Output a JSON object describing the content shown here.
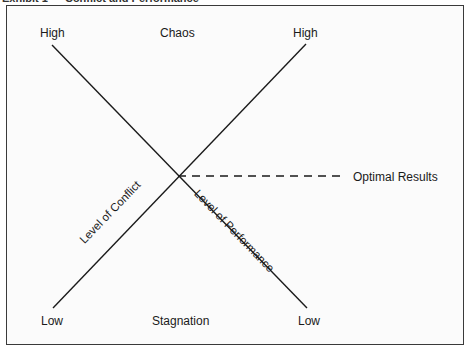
{
  "caption": "Exhibit 1 — Conflict and Performance",
  "labels": {
    "top_left": "High",
    "top_center": "Chaos",
    "top_right": "High",
    "bottom_left": "Low",
    "bottom_center": "Stagnation",
    "bottom_right": "Low",
    "optimal": "Optimal Results",
    "conflict_line": "Level of Conflict",
    "performance_line": "Level of Performance"
  },
  "lines": {
    "performance": {
      "x1": 52,
      "y1": 45,
      "x2": 307,
      "y2": 308
    },
    "conflict": {
      "x1": 53,
      "y1": 308,
      "x2": 306,
      "y2": 44
    },
    "optimal_dashed": {
      "x1": 178,
      "y1": 176,
      "x2": 340,
      "y2": 176
    }
  },
  "colors": {
    "line": "#1a1a1a",
    "border": "#3a3a3a",
    "background": "#fbfbfb"
  }
}
